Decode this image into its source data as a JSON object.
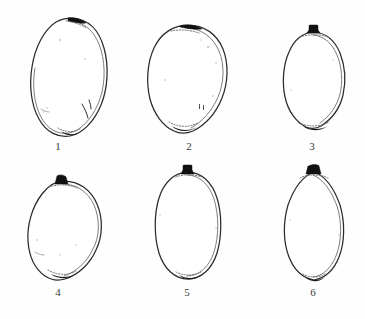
{
  "plate": {
    "title": "Specimen outline plate",
    "description": "Line drawings of six seed outlines numbered 1 to 6",
    "background_color": "#fefefe",
    "ink_color": "#2b2b2b",
    "knob_color": "#111111",
    "label_color": "#3a3a3a",
    "rows": 2,
    "columns": 3,
    "specimen_count": 6
  },
  "specimens": [
    {
      "number": "1",
      "label": "1",
      "shape": "obliquely-ovate",
      "orientation": "tilted right",
      "apex_knob": "dark wedge at upper right of apex",
      "base_scar": "dotted scar with dark nub",
      "bbox": {
        "x": 31,
        "y": 18,
        "width": 76,
        "height": 119
      },
      "label_x": 58,
      "label_y": 146
    },
    {
      "number": "2",
      "label": "2",
      "shape": "broad-obovate",
      "orientation": "upright",
      "apex_knob": "small dark cap at apex",
      "base_scar": "dotted oval scar with dark nub",
      "bbox": {
        "x": 148,
        "y": 25,
        "width": 80,
        "height": 110
      },
      "label_x": 189,
      "label_y": 146
    },
    {
      "number": "3",
      "label": "3",
      "shape": "angular-ovate",
      "orientation": "upright",
      "apex_knob": "solid black square knob",
      "base_scar": "dotted band with dark nub",
      "bbox": {
        "x": 283,
        "y": 28,
        "width": 63,
        "height": 105
      },
      "label_x": 312,
      "label_y": 146
    },
    {
      "number": "4",
      "label": "4",
      "shape": "subglobose",
      "orientation": "upright",
      "apex_knob": "dark pointed knob",
      "base_scar": "dotted scar with dark nub",
      "bbox": {
        "x": 29,
        "y": 176,
        "width": 73,
        "height": 106
      },
      "label_x": 58,
      "label_y": 292
    },
    {
      "number": "5",
      "label": "5",
      "shape": "elliptic",
      "orientation": "upright",
      "apex_knob": "solid black square knob",
      "base_scar": "dotted scar with dark nub",
      "bbox": {
        "x": 155,
        "y": 166,
        "width": 66,
        "height": 116
      },
      "label_x": 187,
      "label_y": 292
    },
    {
      "number": "6",
      "label": "6",
      "shape": "pointed-ovate",
      "orientation": "upright",
      "apex_knob": "solid black knob",
      "base_scar": "dotted scar with dark nub",
      "bbox": {
        "x": 283,
        "y": 166,
        "width": 62,
        "height": 116
      },
      "label_x": 313,
      "label_y": 292
    }
  ]
}
